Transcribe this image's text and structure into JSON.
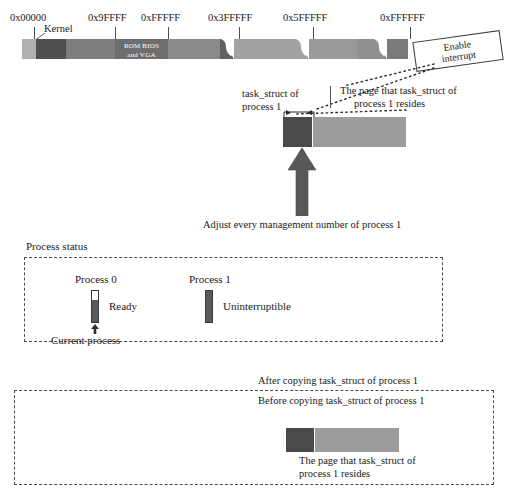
{
  "memory_map": {
    "name": "physical-memory-map",
    "address_labels": [
      {
        "text": "0x00000",
        "x": 10,
        "y": 12,
        "tick_x": 34,
        "tick_y": 26,
        "tick_h": 13
      },
      {
        "text": "0x9FFFF",
        "x": 88,
        "y": 12,
        "tick_x": 115,
        "tick_y": 26,
        "tick_h": 13
      },
      {
        "text": "0xFFFFF",
        "x": 141,
        "y": 12,
        "tick_x": 168,
        "tick_y": 26,
        "tick_h": 13
      },
      {
        "text": "0x3FFFFF",
        "x": 208,
        "y": 12,
        "tick_x": 239,
        "tick_y": 26,
        "tick_h": 13
      },
      {
        "text": "0x5FFFFF",
        "x": 283,
        "y": 12,
        "tick_x": 313,
        "tick_y": 26,
        "tick_h": 13
      },
      {
        "text": "0xFFFFFF",
        "x": 380,
        "y": 12,
        "tick_x": 410,
        "tick_y": 26,
        "tick_h": 13
      }
    ],
    "kernel_label": "Kernel",
    "rom_label_line1": "ROM BIOS",
    "rom_label_line2": "and VGA",
    "segments": [
      {
        "name": "low-memory-seg",
        "x": 0,
        "w": 14,
        "color": "#b0b0b0"
      },
      {
        "name": "kernel-seg",
        "x": 14,
        "w": 30,
        "color": "#5a5a5a"
      },
      {
        "name": "user-low-seg",
        "x": 44,
        "w": 49,
        "color": "#7d7d7d"
      },
      {
        "name": "rom-bios-vga-seg",
        "x": 93,
        "w": 53,
        "color": "#6e6e6e"
      },
      {
        "name": "ext-mem-seg",
        "x": 146,
        "w": 52,
        "color": "#8a8a8a"
      },
      {
        "name": "pre-break1-seg",
        "x": 198,
        "w": 12,
        "color": "#5f5f5f"
      },
      {
        "name": "mid-mem-seg-a",
        "x": 216,
        "w": 70,
        "color": "#a2a2a2"
      },
      {
        "name": "mid-mem-seg-b",
        "x": 293,
        "w": 42,
        "color": "#9a9a9a"
      },
      {
        "name": "high-mem-seg-a",
        "x": 335,
        "w": 28,
        "color": "#8f8f8f"
      },
      {
        "name": "high-mem-seg-b",
        "x": 370,
        "w": 16,
        "color": "#7a7a7a"
      }
    ],
    "breaks": [
      {
        "name": "break-mark-1",
        "x": 203
      },
      {
        "name": "break-mark-2",
        "x": 280
      },
      {
        "name": "break-mark-3",
        "x": 358
      }
    ]
  },
  "enable_interrupt": {
    "line1": "Enable",
    "line2": "interrupt"
  },
  "task_struct_section": {
    "block_label_line1": "task_struct of",
    "block_label_line2": "process 1",
    "page_caption_line1": "The page that task_struct of",
    "page_caption_line2": "process 1 resides",
    "adjust_caption": "Adjust every management number of process 1",
    "dark_color": "#4a4a4a",
    "light_color": "#9c9c9c",
    "arrow_color": "#585858"
  },
  "process_status": {
    "title": "Process status",
    "processes": [
      {
        "name": "process-0",
        "label": "Process 0",
        "state": "Ready",
        "bar_fill_ratio": 0.72,
        "fill_color": "#5a5a5a",
        "annotation": "Current process",
        "has_current_marker": true
      },
      {
        "name": "process-1",
        "label": "Process 1",
        "state": "Uninterruptible",
        "bar_fill_ratio": 1.0,
        "fill_color": "#5a5a5a",
        "annotation": null,
        "has_current_marker": false
      }
    ]
  },
  "bottom_section": {
    "after_copy_label": "After copying task_struct of process 1",
    "before_copy_label": "Before copying task_struct of process 1",
    "page_caption_line1": "The page that task_struct of",
    "page_caption_line2": "process 1 resides",
    "dark_color": "#4a4a4a",
    "light_color": "#9c9c9c"
  }
}
